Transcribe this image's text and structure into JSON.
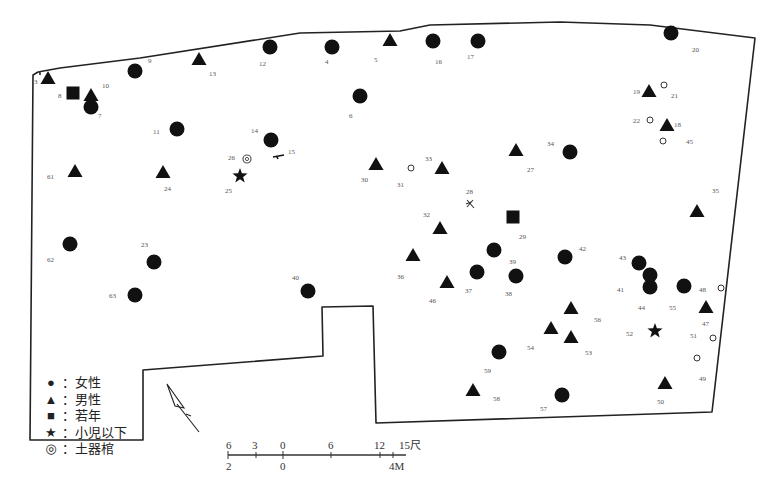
{
  "map": {
    "type": "archaeological-burial-site-plan",
    "outline_color": "#222222",
    "symbol_color": "#111111"
  },
  "legend": {
    "items": [
      {
        "symbol": "circle-filled",
        "glyph": "●",
        "label": "：女性"
      },
      {
        "symbol": "triangle-filled",
        "glyph": "▲",
        "label": "：男性"
      },
      {
        "symbol": "square-filled",
        "glyph": "■",
        "label": "：若年"
      },
      {
        "symbol": "star-filled",
        "glyph": "★",
        "label": "：小児以下"
      },
      {
        "symbol": "double-circle",
        "glyph": "◎",
        "label": "：土器棺"
      }
    ]
  },
  "scale_bar": {
    "top_ticks": [
      "6",
      "3",
      "0",
      "6",
      "12",
      "15尺"
    ],
    "bottom_ticks": [
      "2",
      "0",
      "4M"
    ]
  },
  "north_arrow": {
    "icon": "north-arrow-icon"
  },
  "features": [
    {
      "id": "3",
      "type": "male",
      "x": 48,
      "y": 78,
      "lx": 34,
      "ly": 84
    },
    {
      "id": "8",
      "type": "youth",
      "x": 73,
      "y": 93,
      "lx": 58,
      "ly": 98
    },
    {
      "id": "10",
      "type": "male",
      "x": 91,
      "y": 95,
      "lx": 102,
      "ly": 88
    },
    {
      "id": "7",
      "type": "female",
      "x": 91,
      "y": 107,
      "lx": 98,
      "ly": 118
    },
    {
      "id": "9",
      "type": "female",
      "x": 135,
      "y": 71,
      "lx": 148,
      "ly": 63
    },
    {
      "id": "13",
      "type": "male",
      "x": 199,
      "y": 59,
      "lx": 209,
      "ly": 76
    },
    {
      "id": "12",
      "type": "female",
      "x": 270,
      "y": 47,
      "lx": 259,
      "ly": 66
    },
    {
      "id": "4",
      "type": "female",
      "x": 332,
      "y": 47,
      "lx": 325,
      "ly": 64
    },
    {
      "id": "5",
      "type": "male",
      "x": 390,
      "y": 40,
      "lx": 374,
      "ly": 62
    },
    {
      "id": "16",
      "type": "female",
      "x": 433,
      "y": 41,
      "lx": 435,
      "ly": 64
    },
    {
      "id": "17",
      "type": "female",
      "x": 478,
      "y": 41,
      "lx": 467,
      "ly": 59
    },
    {
      "id": "20",
      "type": "female",
      "x": 671,
      "y": 33,
      "lx": 692,
      "ly": 52
    },
    {
      "id": "6",
      "type": "female",
      "x": 360,
      "y": 96,
      "lx": 349,
      "ly": 118
    },
    {
      "id": "19",
      "type": "male",
      "x": 649,
      "y": 91,
      "lx": 633,
      "ly": 94
    },
    {
      "id": "21",
      "type": "small-circle",
      "x": 664,
      "y": 85,
      "lx": 671,
      "ly": 98
    },
    {
      "id": "22",
      "type": "small-circle",
      "x": 650,
      "y": 120,
      "lx": 633,
      "ly": 123
    },
    {
      "id": "18",
      "type": "male",
      "x": 667,
      "y": 125,
      "lx": 674,
      "ly": 127
    },
    {
      "id": "45",
      "type": "small-circle",
      "x": 663,
      "y": 141,
      "lx": 686,
      "ly": 144
    },
    {
      "id": "11",
      "type": "female",
      "x": 177,
      "y": 129,
      "lx": 153,
      "ly": 134
    },
    {
      "id": "14",
      "type": "female",
      "x": 271,
      "y": 140,
      "lx": 251,
      "ly": 133
    },
    {
      "id": "15",
      "type": "fragment",
      "x": 279,
      "y": 157,
      "lx": 288,
      "ly": 154
    },
    {
      "id": "26",
      "type": "urn-coffin",
      "x": 247,
      "y": 159,
      "lx": 228,
      "ly": 160
    },
    {
      "id": "25",
      "type": "child",
      "x": 240,
      "y": 176,
      "lx": 225,
      "ly": 193
    },
    {
      "id": "61",
      "type": "male",
      "x": 75,
      "y": 171,
      "lx": 47,
      "ly": 179
    },
    {
      "id": "24",
      "type": "male",
      "x": 163,
      "y": 172,
      "lx": 164,
      "ly": 191
    },
    {
      "id": "30",
      "type": "male",
      "x": 376,
      "y": 164,
      "lx": 361,
      "ly": 182
    },
    {
      "id": "31",
      "type": "small-circle",
      "x": 411,
      "y": 168,
      "lx": 397,
      "ly": 187
    },
    {
      "id": "33",
      "type": "male",
      "x": 442,
      "y": 168,
      "lx": 425,
      "ly": 161
    },
    {
      "id": "27",
      "type": "male",
      "x": 516,
      "y": 150,
      "lx": 527,
      "ly": 172
    },
    {
      "id": "34",
      "type": "female",
      "x": 570,
      "y": 152,
      "lx": 547,
      "ly": 146
    },
    {
      "id": "35",
      "type": "male",
      "x": 697,
      "y": 211,
      "lx": 712,
      "ly": 193
    },
    {
      "id": "28",
      "type": "fragment-x",
      "x": 470,
      "y": 204,
      "lx": 466,
      "ly": 194
    },
    {
      "id": "29",
      "type": "youth",
      "x": 513,
      "y": 217,
      "lx": 519,
      "ly": 239
    },
    {
      "id": "32",
      "type": "male",
      "x": 440,
      "y": 228,
      "lx": 423,
      "ly": 217
    },
    {
      "id": "62",
      "type": "female",
      "x": 70,
      "y": 244,
      "lx": 47,
      "ly": 262
    },
    {
      "id": "23",
      "type": "female",
      "x": 154,
      "y": 262,
      "lx": 141,
      "ly": 247
    },
    {
      "id": "63",
      "type": "female",
      "x": 135,
      "y": 295,
      "lx": 109,
      "ly": 298
    },
    {
      "id": "40",
      "type": "female",
      "x": 308,
      "y": 291,
      "lx": 292,
      "ly": 280
    },
    {
      "id": "36",
      "type": "male",
      "x": 413,
      "y": 255,
      "lx": 397,
      "ly": 279
    },
    {
      "id": "39",
      "type": "female",
      "x": 494,
      "y": 250,
      "lx": 509,
      "ly": 264
    },
    {
      "id": "42",
      "type": "female",
      "x": 565,
      "y": 257,
      "lx": 579,
      "ly": 251
    },
    {
      "id": "37",
      "type": "female",
      "x": 477,
      "y": 272,
      "lx": 465,
      "ly": 293
    },
    {
      "id": "38",
      "type": "female",
      "x": 516,
      "y": 276,
      "lx": 505,
      "ly": 296
    },
    {
      "id": "46",
      "type": "male",
      "x": 447,
      "y": 282,
      "lx": 429,
      "ly": 303
    },
    {
      "id": "43",
      "type": "female",
      "x": 639,
      "y": 263,
      "lx": 619,
      "ly": 260
    },
    {
      "id": "41",
      "type": "female",
      "x": 650,
      "y": 287,
      "lx": 617,
      "ly": 292
    },
    {
      "id": "44",
      "type": "female",
      "x": 650,
      "y": 275,
      "lx": 638,
      "ly": 310
    },
    {
      "id": "55",
      "type": "female",
      "x": 684,
      "y": 286,
      "lx": 669,
      "ly": 310
    },
    {
      "id": "48",
      "type": "small-circle",
      "x": 721,
      "y": 288,
      "lx": 699,
      "ly": 292
    },
    {
      "id": "47",
      "type": "male",
      "x": 706,
      "y": 307,
      "lx": 702,
      "ly": 326
    },
    {
      "id": "56",
      "type": "male",
      "x": 571,
      "y": 308,
      "lx": 594,
      "ly": 322
    },
    {
      "id": "54",
      "type": "male",
      "x": 551,
      "y": 328,
      "lx": 527,
      "ly": 350
    },
    {
      "id": "53",
      "type": "male",
      "x": 571,
      "y": 337,
      "lx": 585,
      "ly": 355
    },
    {
      "id": "52",
      "type": "child",
      "x": 655,
      "y": 331,
      "lx": 626,
      "ly": 336
    },
    {
      "id": "51",
      "type": "small-circle",
      "x": 713,
      "y": 338,
      "lx": 690,
      "ly": 338
    },
    {
      "id": "59",
      "type": "female",
      "x": 499,
      "y": 352,
      "lx": 484,
      "ly": 373
    },
    {
      "id": "49",
      "type": "small-circle",
      "x": 697,
      "y": 358,
      "lx": 699,
      "ly": 381
    },
    {
      "id": "58",
      "type": "male",
      "x": 473,
      "y": 390,
      "lx": 493,
      "ly": 401
    },
    {
      "id": "57",
      "type": "female",
      "x": 562,
      "y": 395,
      "lx": 540,
      "ly": 411
    },
    {
      "id": "50",
      "type": "male",
      "x": 665,
      "y": 383,
      "lx": 657,
      "ly": 404
    }
  ]
}
